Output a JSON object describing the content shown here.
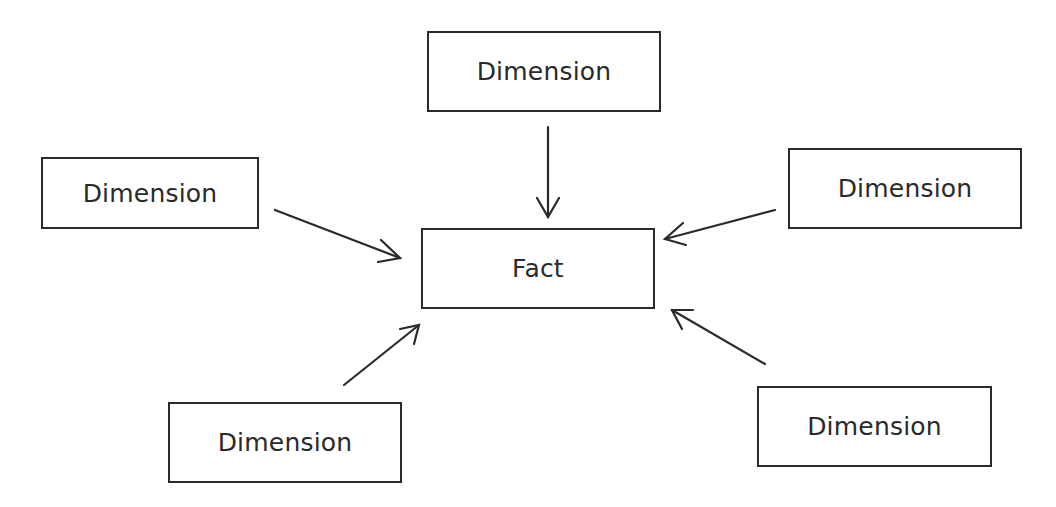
{
  "diagram": {
    "type": "star-schema",
    "center": {
      "label": "Fact"
    },
    "dimensions": [
      {
        "position": "top",
        "label": "Dimension"
      },
      {
        "position": "left",
        "label": "Dimension"
      },
      {
        "position": "right",
        "label": "Dimension"
      },
      {
        "position": "bottom-left",
        "label": "Dimension"
      },
      {
        "position": "bottom-right",
        "label": "Dimension"
      }
    ],
    "edges": [
      {
        "from": "top",
        "to": "center"
      },
      {
        "from": "left",
        "to": "center"
      },
      {
        "from": "right",
        "to": "center"
      },
      {
        "from": "bottom-left",
        "to": "center"
      },
      {
        "from": "bottom-right",
        "to": "center"
      }
    ],
    "colors": {
      "stroke": "#2a2a2a",
      "background": "#ffffff"
    }
  }
}
